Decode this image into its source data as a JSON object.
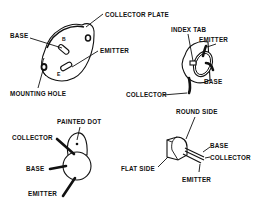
{
  "diagram": {
    "packages": [
      {
        "id": "power-case",
        "labels": {
          "collector_plate": "COLLECTOR PLATE",
          "base": "BASE",
          "emitter": "EMITTER",
          "mounting_hole": "MOUNTING HOLE",
          "pin_b": "B",
          "pin_e": "E"
        }
      },
      {
        "id": "metal-can-index-tab",
        "labels": {
          "index_tab": "INDEX TAB",
          "emitter": "EMITTER",
          "base": "BASE",
          "collector": "COLLECTOR"
        }
      },
      {
        "id": "painted-dot-case",
        "labels": {
          "painted_dot": "PAINTED DOT",
          "collector": "COLLECTOR",
          "base": "BASE",
          "emitter": "EMITTER"
        }
      },
      {
        "id": "plastic-flat-side",
        "labels": {
          "round_side": "ROUND SIDE",
          "flat_side": "FLAT SIDE",
          "base": "BASE",
          "collector": "COLLECTOR",
          "emitter": "EMITTER"
        }
      }
    ]
  }
}
